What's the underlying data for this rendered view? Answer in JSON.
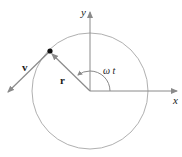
{
  "diagram": {
    "labels": {
      "x_axis": "x",
      "y_axis": "y",
      "position_vector": "r",
      "velocity_vector": "v",
      "angle": "ω t"
    },
    "colors": {
      "circle": "#aaaaaa",
      "axes": "#8a8a8a",
      "vectors": "#8a8a8a",
      "particle": "#111111",
      "text": "#1a1a1a"
    }
  }
}
